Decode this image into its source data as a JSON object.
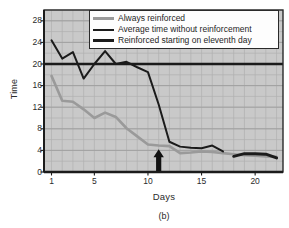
{
  "chart_data": {
    "type": "line",
    "title": "",
    "caption": "(b)",
    "xlabel": "Days",
    "ylabel": "Time",
    "xlim": [
      0.3,
      22.6
    ],
    "ylim": [
      0,
      30
    ],
    "xticks": [
      1,
      5,
      10,
      15,
      20
    ],
    "yticks": [
      0,
      4,
      8,
      12,
      16,
      20,
      24,
      28
    ],
    "grid": true,
    "grid_color": "#b0b0b0",
    "plot_background": "#c9c9c9",
    "legend_position": "top-right-inside",
    "series": [
      {
        "name": "Always reinforced",
        "color": "#9a9a9a",
        "width": 2.6,
        "x": [
          1,
          2,
          3,
          4,
          5,
          6,
          7,
          8,
          9,
          10,
          11,
          12,
          13,
          14,
          15,
          16,
          17,
          18,
          19,
          20,
          21,
          22
        ],
        "y": [
          17.8,
          13.2,
          13.0,
          11.6,
          10.0,
          11.0,
          10.2,
          8.1,
          6.6,
          5.1,
          4.9,
          4.8,
          3.5,
          3.6,
          3.8,
          3.7,
          3.5,
          3.3,
          3.1,
          3.0,
          2.9,
          2.8
        ]
      },
      {
        "name": "Average time without reinforcement",
        "color": "#1b1b1b",
        "width": 2.0,
        "x": [
          1,
          2,
          3,
          4,
          5,
          6,
          7,
          8,
          9,
          10,
          11,
          12,
          13,
          14,
          15,
          16,
          17
        ],
        "y": [
          24.4,
          21.0,
          22.2,
          17.3,
          20.0,
          22.4,
          20.0,
          20.4,
          19.4,
          18.5,
          12.5,
          5.6,
          4.7,
          4.5,
          4.4,
          4.9,
          3.8
        ]
      },
      {
        "name": "Reinforced starting on eleventh day",
        "color": "#1b1b1b",
        "width": 3.0,
        "x": [
          18,
          19,
          20,
          21,
          22
        ],
        "y": [
          2.9,
          3.4,
          3.4,
          3.3,
          2.6
        ]
      }
    ],
    "reference_line": {
      "name": "baseline",
      "orientation": "horizontal",
      "value": 20,
      "color": "#1b1b1b",
      "width": 2.6
    },
    "annotations": [
      {
        "name": "eleventh-day-arrow",
        "kind": "up-arrow",
        "x": 11,
        "y_from": 0,
        "y_to": 4.2,
        "color": "#121212"
      }
    ]
  },
  "legend": {
    "items": [
      {
        "label": "Always reinforced",
        "swatch": "sw-gray"
      },
      {
        "label": "Average time without reinforcement",
        "swatch": "sw-thin"
      },
      {
        "label": "Reinforced starting on eleventh day",
        "swatch": "sw-thick"
      }
    ]
  },
  "axes": {
    "ylabel": "Time",
    "xlabel": "Days",
    "caption": "(b)",
    "ytick_labels": [
      "0",
      "4",
      "8",
      "12",
      "16",
      "20",
      "24",
      "28"
    ],
    "xtick_labels": [
      "1",
      "5",
      "10",
      "15",
      "20"
    ]
  }
}
